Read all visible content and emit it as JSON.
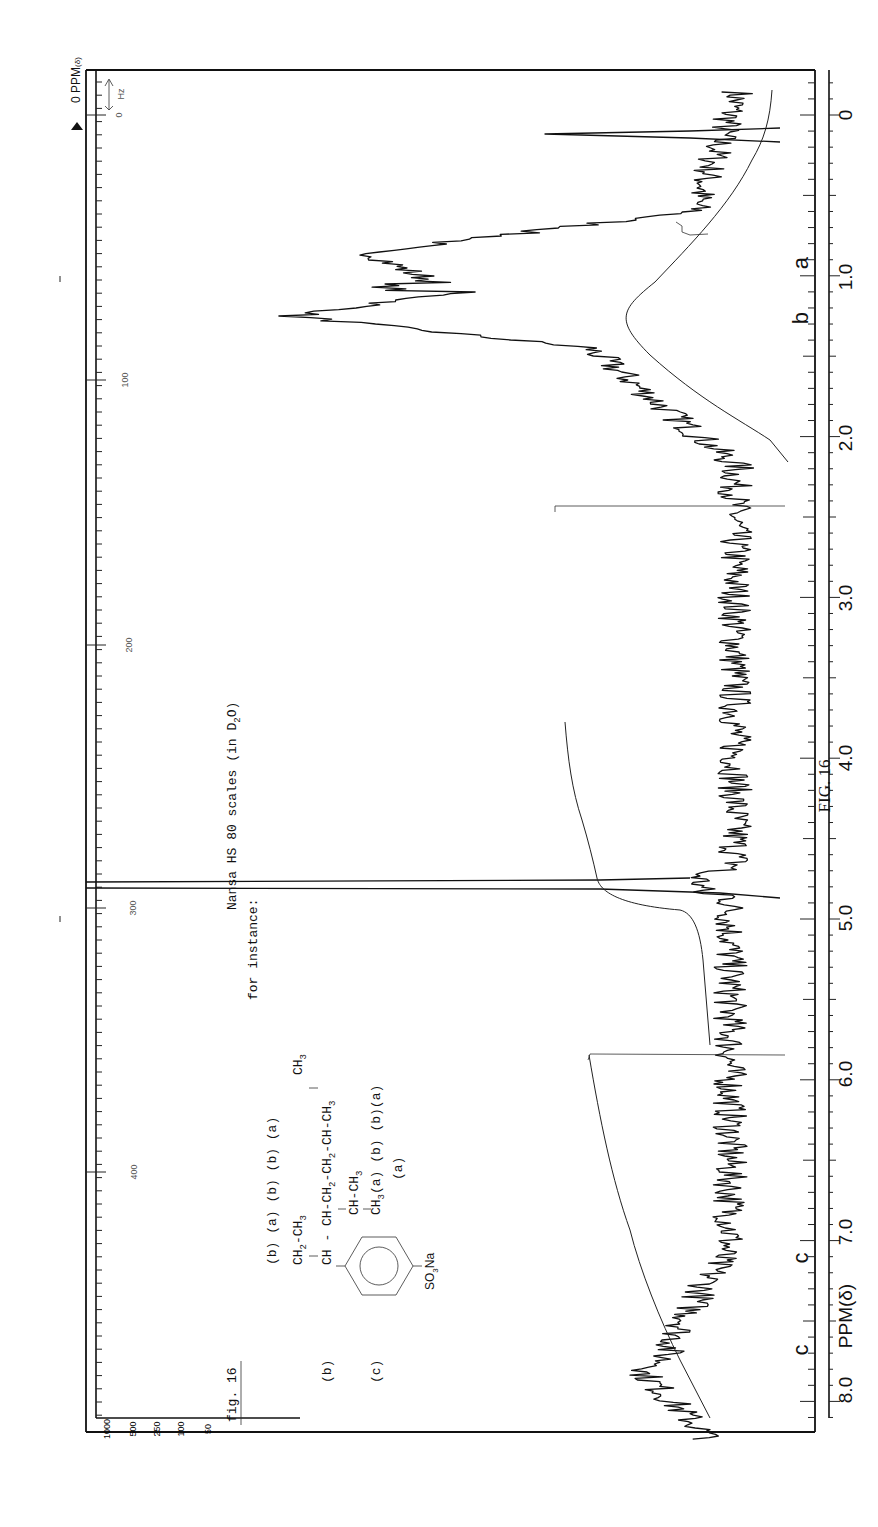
{
  "figure": {
    "caption": "FIG. 16",
    "inset_label": "fig. 16",
    "sample_title_line1": "Nansa HS 80 scales (in D",
    "sample_title_sub": "2",
    "sample_title_end": "O)",
    "sample_title_line2": "for instance:",
    "axis_title": "PPM(δ)",
    "top_corner_label": "PPM",
    "top_corner_unit": "(δ)",
    "hz_label": "Hz",
    "structure": {
      "row_labels": [
        "(b)",
        "(a)",
        "(b)",
        "(b)",
        "(a)"
      ],
      "side_label_b": "(b)",
      "side_label_c": "(c)",
      "line1": "CH2-CH3",
      "line_top_methyl": "CH3",
      "line2": "CH - CH-CH2-CH2-CH-CH3",
      "line3": "CH-CH3",
      "line4": "CH3",
      "line4_tags": "(a)  (b) (b)(a)",
      "line5_tag": "(a)",
      "substituent": "SO3Na"
    },
    "peak_assignments": [
      {
        "label": "a",
        "ppm": 0.9
      },
      {
        "label": "b",
        "ppm": 1.3
      },
      {
        "label": "c",
        "ppm": 7.2
      },
      {
        "label": "c",
        "ppm": 7.8
      }
    ]
  },
  "chart_data": {
    "type": "line",
    "xlabel": "PPM(δ)",
    "ylabel": "",
    "orientation": "rotated 90° (ppm axis vertical on right, 0 at top)",
    "x_ticks": [
      "0",
      "1.0",
      "2.0",
      "3.0",
      "4.0",
      "5.0",
      "6.0",
      "7.0",
      "8.0"
    ],
    "x_range_ppm": [
      8.3,
      -0.2
    ],
    "hz_scale_ticks": [
      "0",
      "100",
      "200",
      "300",
      "400"
    ],
    "spectrum_amplitude_scale": [
      "1000",
      "500",
      "250",
      "100",
      "50"
    ],
    "peaks": [
      {
        "ppm": 0.13,
        "relative_intensity": 0.55,
        "note": "sharp reference peak"
      },
      {
        "ppm": 0.9,
        "relative_intensity": 1.0,
        "label": "a"
      },
      {
        "ppm": 1.1,
        "relative_intensity": 0.72,
        "label": "a"
      },
      {
        "ppm": 1.25,
        "relative_intensity": 0.95,
        "label": "b"
      },
      {
        "ppm": 2.45,
        "relative_intensity": 0.45,
        "note": "sharp spike"
      },
      {
        "ppm": 4.85,
        "relative_intensity": 1.25,
        "note": "HDO solvent peak, off-scale"
      },
      {
        "ppm": 5.92,
        "relative_intensity": 0.55,
        "note": "sharp spike"
      },
      {
        "ppm": 7.2,
        "relative_intensity": 0.25,
        "label": "c"
      },
      {
        "ppm": 7.8,
        "relative_intensity": 0.3,
        "label": "c"
      }
    ],
    "integral_segments": [
      {
        "from_ppm": -0.2,
        "to_ppm": 2.4,
        "note": "aliphatic integral rising"
      },
      {
        "from_ppm": 3.8,
        "to_ppm": 6.0,
        "note": "step at ~5.0"
      },
      {
        "from_ppm": 5.9,
        "to_ppm": 8.3,
        "note": "aromatic integral"
      }
    ]
  }
}
